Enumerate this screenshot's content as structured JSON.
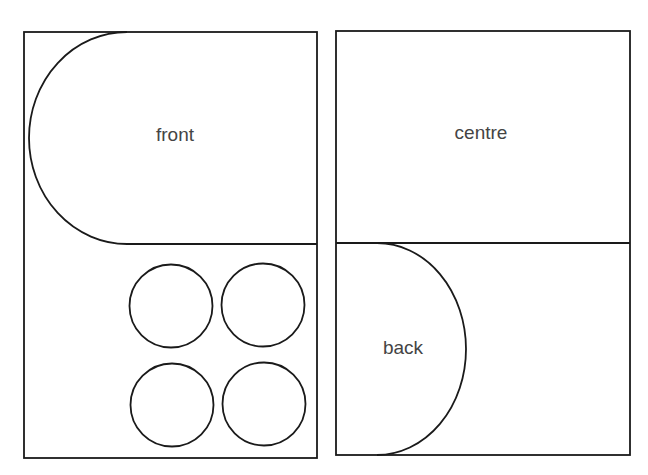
{
  "diagram": {
    "stroke_color": "#1a1a1a",
    "text_color": "#444444",
    "background": "#ffffff",
    "panels": [
      {
        "id": "left-panel",
        "regions": [
          {
            "id": "front",
            "label": "front",
            "shape": "half-stadium (semicircular left end)"
          },
          {
            "id": "circles",
            "label": "",
            "shape": "2x2 grid of circles",
            "count": 4
          }
        ]
      },
      {
        "id": "right-panel",
        "regions": [
          {
            "id": "centre",
            "label": "centre",
            "shape": "rectangle"
          },
          {
            "id": "back",
            "label": "back",
            "shape": "semicircle"
          }
        ]
      }
    ],
    "labels": {
      "front": "front",
      "centre": "centre",
      "back": "back"
    }
  }
}
